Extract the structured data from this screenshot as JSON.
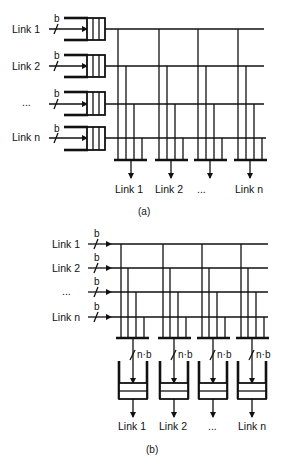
{
  "figure": {
    "panel_a": {
      "caption": "(a)",
      "inputs": [
        {
          "label": "Link 1",
          "width": "b"
        },
        {
          "label": "Link 2",
          "width": "b"
        },
        {
          "label": "...",
          "width": "b"
        },
        {
          "label": "Link n",
          "width": "b"
        }
      ],
      "outputs": [
        "Link 1",
        "Link 2",
        "...",
        "Link n"
      ],
      "description": "Input-queued crossbar: each input link passes through a queue then onto a horizontal bus; vertical taps feed output buses"
    },
    "panel_b": {
      "caption": "(b)",
      "inputs": [
        {
          "label": "Link 1",
          "width": "b"
        },
        {
          "label": "Link 2",
          "width": "b"
        },
        {
          "label": "...",
          "width": "b"
        },
        {
          "label": "Link n",
          "width": "b"
        }
      ],
      "bus_width": "n·b",
      "outputs": [
        "Link 1",
        "Link 2",
        "...",
        "Link n"
      ],
      "description": "Output-queued switch: horizontal input buses tapped into n·b wide output buses feeding output queues"
    }
  }
}
